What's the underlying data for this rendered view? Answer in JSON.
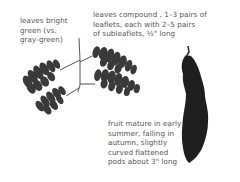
{
  "annotations": {
    "leaves_color": "leaves bright\ngreen (vs.\ngray-green)",
    "leaves_compound": "leaves compound , 1–3 pairs of\nleaflets, each with 2–5 pairs\nof subleaflets, ½\" long",
    "fruit": "fruit mature in early\nsummer, falling in\nautumn, slightly\ncurved flattened\npods about 3\" long"
  },
  "illustrations": [
    {
      "name": "compound-leaf",
      "description": "bipinnately compound leaf with 3 leaflet branches"
    },
    {
      "name": "seed-pod",
      "description": "dark curved flattened pod"
    }
  ],
  "colors": {
    "text": "#555555",
    "leaf": "#3a3a3a",
    "pod": "#1f1f1f",
    "background": "#ffffff"
  }
}
